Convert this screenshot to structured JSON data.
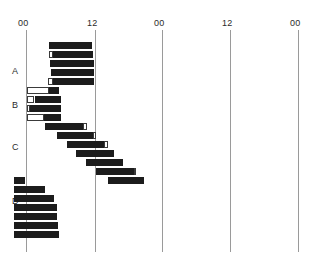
{
  "chart_data": {
    "type": "bar",
    "title": "",
    "subtitle": "",
    "xlabel": "",
    "ylabel": "",
    "plot_style": "double-plotted actogram",
    "axis_ticks": [
      {
        "label": "00",
        "hour": 0,
        "x": 26
      },
      {
        "label": "12",
        "hour": 12,
        "x": 95
      },
      {
        "label": "00",
        "hour": 24,
        "x": 162
      },
      {
        "label": "12",
        "hour": 36,
        "x": 230
      },
      {
        "label": "00",
        "hour": 48,
        "x": 298
      }
    ],
    "axis_range_hours": [
      0,
      48
    ],
    "grid": false,
    "legend": null,
    "row_labels": [
      {
        "label": "A",
        "x": 12,
        "y": 66
      },
      {
        "label": "B",
        "x": 12,
        "y": 100
      },
      {
        "label": "C",
        "x": 12,
        "y": 142
      },
      {
        "label": "D",
        "x": 12,
        "y": 196
      }
    ],
    "colors": {
      "filled_bar": "#1c1c1c",
      "open_bar_fill": "#ffffff",
      "open_bar_stroke": "#3a3a3a",
      "axis": "#9a9a9a",
      "text": "#2b2b2b",
      "background": "#ffffff"
    },
    "geometry": {
      "plot_left_x": 26,
      "hours_per_pixel": 0.1765,
      "pixels_per_hour": 5.667,
      "first_row_y": 42,
      "row_pitch": 9.0,
      "bar_height": 7,
      "n_rows": 22
    },
    "rows": [
      {
        "day": 1,
        "y": 42,
        "section": "A",
        "bouts": [
          {
            "start_h": 4.0,
            "dur_h": 7.6,
            "style": "filled"
          }
        ]
      },
      {
        "day": 2,
        "y": 51,
        "section": "A",
        "bouts": [
          {
            "start_h": 4.0,
            "dur_h": 0.7,
            "style": "open"
          },
          {
            "start_h": 4.7,
            "dur_h": 7.1,
            "style": "filled"
          }
        ]
      },
      {
        "day": 3,
        "y": 60,
        "section": "A",
        "bouts": [
          {
            "start_h": 4.2,
            "dur_h": 7.8,
            "style": "filled"
          }
        ]
      },
      {
        "day": 4,
        "y": 69,
        "section": "A",
        "bouts": [
          {
            "start_h": 4.4,
            "dur_h": 7.6,
            "style": "filled"
          }
        ]
      },
      {
        "day": 5,
        "y": 78,
        "section": "A",
        "bouts": [
          {
            "start_h": 3.8,
            "dur_h": 0.9,
            "style": "open"
          },
          {
            "start_h": 4.7,
            "dur_h": 7.3,
            "style": "filled"
          }
        ]
      },
      {
        "day": 6,
        "y": 87,
        "section": "B",
        "bouts": [
          {
            "start_h": 0.2,
            "dur_h": 3.8,
            "style": "open"
          },
          {
            "start_h": 4.0,
            "dur_h": 1.8,
            "style": "filled"
          }
        ]
      },
      {
        "day": 7,
        "y": 96,
        "section": "B",
        "bouts": [
          {
            "start_h": 0.2,
            "dur_h": 1.3,
            "style": "open"
          },
          {
            "start_h": 1.5,
            "dur_h": 4.6,
            "style": "filled"
          }
        ]
      },
      {
        "day": 8,
        "y": 105,
        "section": "B",
        "bouts": [
          {
            "start_h": 0.2,
            "dur_h": 0.5,
            "style": "open"
          },
          {
            "start_h": 0.7,
            "dur_h": 5.5,
            "style": "filled"
          }
        ]
      },
      {
        "day": 9,
        "y": 114,
        "section": "B",
        "bouts": [
          {
            "start_h": 0.2,
            "dur_h": 3.0,
            "style": "open"
          },
          {
            "start_h": 3.2,
            "dur_h": 2.9,
            "style": "filled"
          }
        ]
      },
      {
        "day": 10,
        "y": 123,
        "section": "B",
        "bouts": [
          {
            "start_h": 3.3,
            "dur_h": 6.8,
            "style": "filled"
          },
          {
            "start_h": 10.1,
            "dur_h": 0.6,
            "style": "open"
          }
        ]
      },
      {
        "day": 11,
        "y": 132,
        "section": "C",
        "bouts": [
          {
            "start_h": 5.4,
            "dur_h": 6.4,
            "style": "filled"
          },
          {
            "start_h": 11.8,
            "dur_h": 0.6,
            "style": "open"
          }
        ]
      },
      {
        "day": 12,
        "y": 141,
        "section": "C",
        "bouts": [
          {
            "start_h": 7.2,
            "dur_h": 6.6,
            "style": "filled"
          },
          {
            "start_h": 13.8,
            "dur_h": 0.6,
            "style": "open"
          }
        ]
      },
      {
        "day": 13,
        "y": 150,
        "section": "C",
        "bouts": [
          {
            "start_h": 8.8,
            "dur_h": 6.8,
            "style": "filled"
          }
        ]
      },
      {
        "day": 14,
        "y": 159,
        "section": "C",
        "bouts": [
          {
            "start_h": 10.6,
            "dur_h": 6.6,
            "style": "filled"
          }
        ]
      },
      {
        "day": 15,
        "y": 168,
        "section": "C",
        "bouts": [
          {
            "start_h": 12.4,
            "dur_h": 6.6,
            "style": "filled"
          },
          {
            "start_h": 19.0,
            "dur_h": 0.5,
            "style": "open"
          }
        ]
      },
      {
        "day": 16,
        "y": 177,
        "section": "D",
        "bouts": [
          {
            "start_h": -2.2,
            "dur_h": 2.0,
            "style": "filled"
          },
          {
            "start_h": 14.4,
            "dur_h": 6.4,
            "style": "filled"
          }
        ]
      },
      {
        "day": 17,
        "y": 186,
        "section": "D",
        "bouts": [
          {
            "start_h": -2.2,
            "dur_h": 5.6,
            "style": "filled"
          }
        ]
      },
      {
        "day": 18,
        "y": 195,
        "section": "D",
        "bouts": [
          {
            "start_h": -2.2,
            "dur_h": 7.2,
            "style": "filled"
          }
        ]
      },
      {
        "day": 19,
        "y": 204,
        "section": "D",
        "bouts": [
          {
            "start_h": -2.2,
            "dur_h": 7.6,
            "style": "filled"
          }
        ]
      },
      {
        "day": 20,
        "y": 213,
        "section": "D",
        "bouts": [
          {
            "start_h": -2.2,
            "dur_h": 7.6,
            "style": "filled"
          }
        ]
      },
      {
        "day": 21,
        "y": 222,
        "section": "D",
        "bouts": [
          {
            "start_h": -2.2,
            "dur_h": 7.8,
            "style": "filled"
          }
        ]
      },
      {
        "day": 22,
        "y": 231,
        "section": "D",
        "bouts": [
          {
            "start_h": -2.2,
            "dur_h": 8.0,
            "style": "filled"
          }
        ]
      }
    ]
  }
}
